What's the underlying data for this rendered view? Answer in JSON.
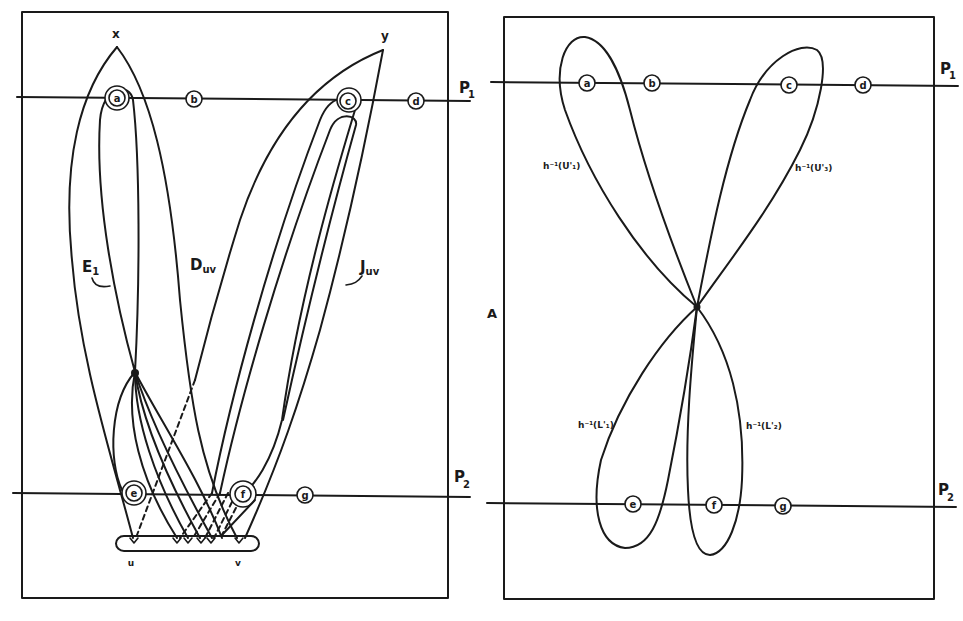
{
  "figure": {
    "left_panel": {
      "labels": {
        "x": "x",
        "y": "y",
        "E1": "E",
        "E1_sub": "1",
        "Duv": "D",
        "Duv_sub": "uv",
        "Juv": "J",
        "Juv_sub": "uv",
        "u": "u",
        "v": "v",
        "P1": "P",
        "P1_sub": "1",
        "P2": "P",
        "P2_sub": "2"
      },
      "points_P1": [
        "a",
        "b",
        "c",
        "d"
      ],
      "points_P2": [
        "e",
        "f",
        "g"
      ]
    },
    "right_panel": {
      "labels": {
        "A": "A",
        "P1": "P",
        "P1_sub": "1",
        "P2": "P",
        "P2_sub": "2",
        "U1": "h⁻¹(U'₁)",
        "U3": "h⁻¹(U'₃)",
        "L1": "h⁻¹(L'₁)",
        "L2": "h⁻¹(L'₂)"
      },
      "points_P1": [
        "a",
        "b",
        "c",
        "d"
      ],
      "points_P2": [
        "e",
        "f",
        "g"
      ]
    }
  }
}
